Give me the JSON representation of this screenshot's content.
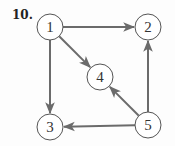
{
  "problem": {
    "number": "10."
  },
  "graph": {
    "directed": true,
    "node_radius": 13,
    "colors": {
      "edge": "#6b6b6b",
      "node_stroke": "#555555",
      "node_fill": "#ffffff",
      "text": "#333333"
    },
    "nodes": [
      {
        "id": "1",
        "label": "1",
        "x": 50,
        "y": 27
      },
      {
        "id": "2",
        "label": "2",
        "x": 148,
        "y": 27
      },
      {
        "id": "3",
        "label": "3",
        "x": 50,
        "y": 127
      },
      {
        "id": "4",
        "label": "4",
        "x": 100,
        "y": 77
      },
      {
        "id": "5",
        "label": "5",
        "x": 148,
        "y": 125
      }
    ],
    "edges": [
      {
        "from": "1",
        "to": "2"
      },
      {
        "from": "1",
        "to": "4"
      },
      {
        "from": "1",
        "to": "3"
      },
      {
        "from": "5",
        "to": "2"
      },
      {
        "from": "5",
        "to": "4"
      },
      {
        "from": "5",
        "to": "3"
      }
    ]
  }
}
